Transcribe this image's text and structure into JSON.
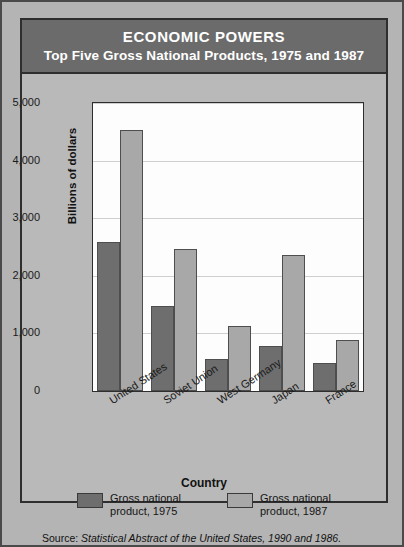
{
  "title": {
    "main": "ECONOMIC POWERS",
    "sub": "Top Five Gross National Products, 1975 and 1987"
  },
  "source": {
    "prefix": "Source: ",
    "citation": "Statistical Abstract of the United States, 1990 and 1986."
  },
  "colors": {
    "series_1975": "#6e6e6e",
    "series_1987": "#a8a8a8",
    "title_band": "#6b6b6b",
    "background": "#b4b4b4",
    "plot_background": "#fdfdfd",
    "frame": "#2e2e2e",
    "gridline": "#cfcfcf"
  },
  "chart_data": {
    "type": "bar",
    "xlabel": "Country",
    "ylabel": "Billions of dollars",
    "categories": [
      "United States",
      "Soviet Union",
      "West Germany",
      "Japan",
      "France"
    ],
    "series": [
      {
        "name": "Gross national product, 1975",
        "values": [
          2580,
          1480,
          560,
          780,
          480
        ]
      },
      {
        "name": "Gross national product, 1987",
        "values": [
          4530,
          2460,
          1130,
          2370,
          880
        ]
      }
    ],
    "ylim": [
      0,
      5000
    ],
    "yticks": [
      0,
      1000,
      2000,
      3000,
      4000,
      5000
    ],
    "ytick_labels": [
      "0",
      "1,000",
      "2,000",
      "3,000",
      "4,000",
      "5,000"
    ],
    "grid": true,
    "legend_position": "bottom",
    "xtick_rotation": -33
  },
  "legend": [
    {
      "label": "Gross national\nproduct, 1975",
      "color": "#6e6e6e"
    },
    {
      "label": "Gross national\nproduct, 1987",
      "color": "#a8a8a8"
    }
  ]
}
